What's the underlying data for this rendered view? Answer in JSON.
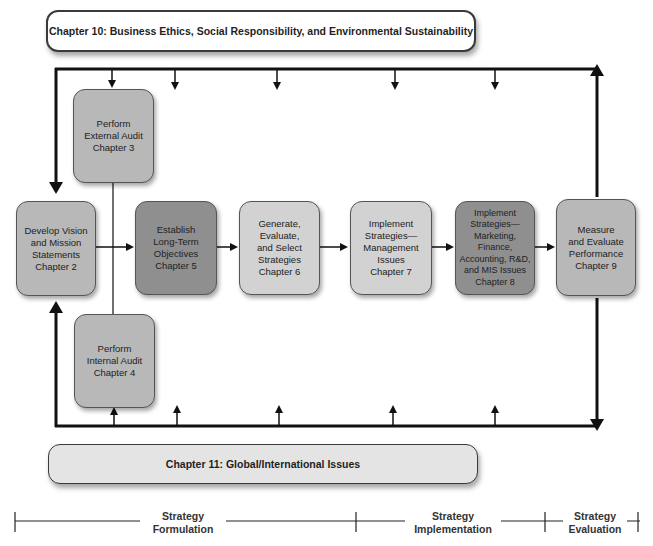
{
  "banners": {
    "top": "Chapter 10: Business Ethics, Social Responsibility, and Environmental Sustainability",
    "bottom": "Chapter 11:  Global/International Issues"
  },
  "boxes": {
    "vision": [
      "Develop Vision",
      "and Mission",
      "Statements",
      "Chapter 2"
    ],
    "external_audit": [
      "Perform",
      "External Audit",
      "Chapter 3"
    ],
    "internal_audit": [
      "Perform",
      "Internal Audit",
      "Chapter 4"
    ],
    "objectives": [
      "Establish",
      "Long-Term",
      "Objectives",
      "Chapter 5"
    ],
    "generate": [
      "Generate,",
      "Evaluate,",
      "and Select",
      "Strategies",
      "Chapter 6"
    ],
    "implement_mgmt": [
      "Implement",
      "Strategies—",
      "Management",
      "Issues",
      "Chapter 7"
    ],
    "implement_mkt": [
      "Implement",
      "Strategies—",
      "Marketing,",
      "Finance,",
      "Accounting, R&D,",
      "and MIS Issues",
      "Chapter 8"
    ],
    "measure": [
      "Measure",
      "and Evaluate",
      "Performance",
      "Chapter 9"
    ]
  },
  "phases": {
    "formulation": [
      "Strategy",
      "Formulation"
    ],
    "implementation": [
      "Strategy",
      "Implementation"
    ],
    "evaluation": [
      "Strategy",
      "Evaluation"
    ]
  },
  "colors": {
    "box_medium": "#b8b8b8",
    "box_dark": "#8f8f8f",
    "box_light": "#d2d2d2",
    "line": "#111111"
  }
}
